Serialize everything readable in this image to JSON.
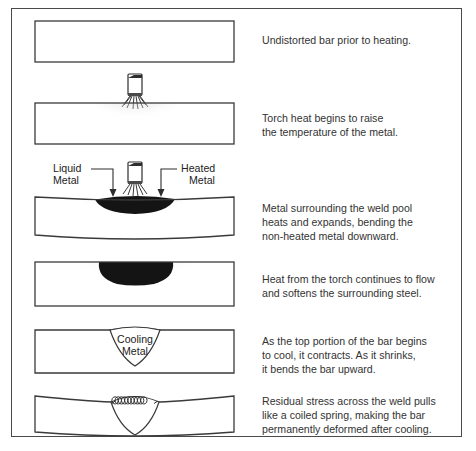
{
  "figure": {
    "colors": {
      "frame": "#4a4a4a",
      "bar_outline": "#3a3a3a",
      "bar_fill": "#ffffff",
      "weld_pool": "#1a1a1a",
      "heat_stipple": "#bdbdbd",
      "text": "#333333",
      "background": "#ffffff"
    }
  },
  "panels": [
    {
      "id": "panel-1",
      "stage": 1,
      "caption": "Undistorted bar prior to heating.",
      "art": "straight-bar",
      "labels": []
    },
    {
      "id": "panel-2",
      "stage": 2,
      "caption": "Torch heat begins to raise\nthe temperature of the metal.",
      "art": "bar-with-torch",
      "labels": []
    },
    {
      "id": "panel-3",
      "stage": 3,
      "caption": "Metal surrounding the weld pool\nheats and expands, bending the\nnon-heated metal downward.",
      "art": "bent-bar-torch-weld-pool",
      "labels": [
        {
          "id": "label-liquid-metal",
          "line1": "Liquid",
          "line2": "Metal",
          "side": "left"
        },
        {
          "id": "label-heated-metal",
          "line1": "Heated",
          "line2": "Metal",
          "side": "right"
        }
      ]
    },
    {
      "id": "panel-4",
      "stage": 4,
      "caption": "Heat from the torch continues to flow\nand softens the surrounding steel.",
      "art": "bar-with-weld-pool",
      "labels": []
    },
    {
      "id": "panel-5",
      "stage": 5,
      "caption": "As the top portion of the bar begins\nto cool, it contracts. As it shrinks,\nit bends the bar upward.",
      "art": "bar-cooling-bead",
      "labels": [
        {
          "id": "label-cooling-metal",
          "line1": "Cooling",
          "line2": "Metal",
          "side": "center"
        }
      ]
    },
    {
      "id": "panel-6",
      "stage": 6,
      "caption": "Residual stress across the weld pulls\nlike a coiled spring, making the bar\npermanently deformed after cooling.",
      "art": "bar-residual-spring",
      "labels": []
    }
  ]
}
